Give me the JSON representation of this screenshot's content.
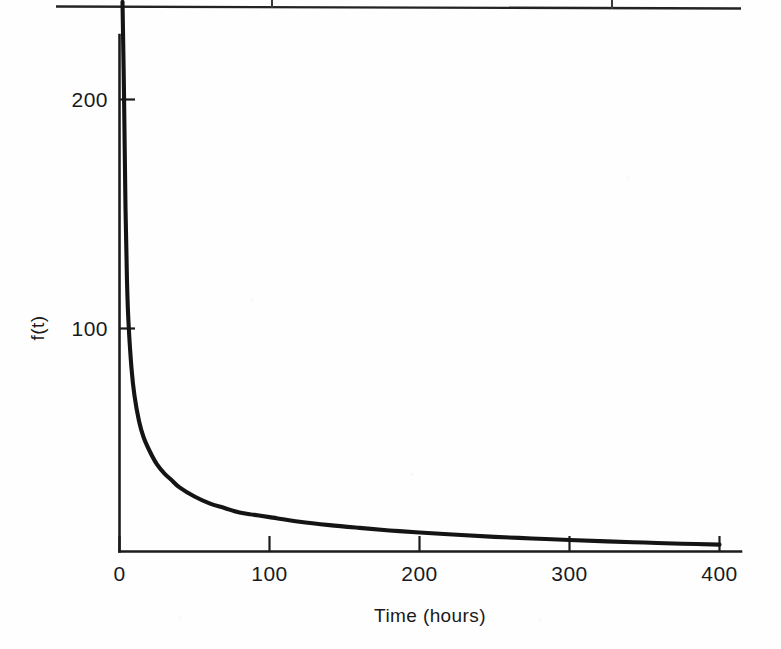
{
  "page": {
    "background_color": "#fefefe",
    "ink_color": "#141414",
    "width": 781,
    "height": 649
  },
  "table_remnant": {
    "name": "partial-table-rule",
    "description": "bottom rule of a table cropped above the figure",
    "rule_y": 7,
    "column_divider_x": [
      272,
      612
    ],
    "divider_height": 8,
    "color": "#232323"
  },
  "chart_data": {
    "type": "line",
    "title": "",
    "subtitle": "",
    "xlabel": "Time (hours)",
    "ylabel": "f(t)",
    "xlim": [
      0,
      400
    ],
    "ylim": [
      0,
      240
    ],
    "xticks": [
      0,
      100,
      200,
      300,
      400
    ],
    "xtick_labels": [
      "0",
      "100",
      "200",
      "300",
      "400"
    ],
    "yticks": [
      100,
      200
    ],
    "ytick_labels": [
      "100",
      "200"
    ],
    "grid": false,
    "legend": null,
    "legend_position": "none",
    "annotations": [],
    "series": [
      {
        "name": "f(t)",
        "color": "#141414",
        "linewidth": 4.1,
        "x": [
          2,
          3,
          4,
          5,
          6,
          8,
          10,
          13,
          16,
          20,
          25,
          30,
          35,
          40,
          50,
          60,
          70,
          80,
          90,
          100,
          120,
          140,
          160,
          180,
          200,
          225,
          250,
          275,
          300,
          325,
          350,
          375,
          400
        ],
        "y": [
          240,
          200,
          150,
          118,
          100,
          80,
          68,
          57,
          50,
          44,
          38,
          34,
          31,
          28,
          24,
          21,
          19,
          17,
          16,
          15,
          13,
          11.5,
          10.3,
          9.2,
          8.3,
          7.3,
          6.4,
          5.7,
          5.0,
          4.4,
          3.9,
          3.4,
          3.0
        ]
      }
    ]
  }
}
